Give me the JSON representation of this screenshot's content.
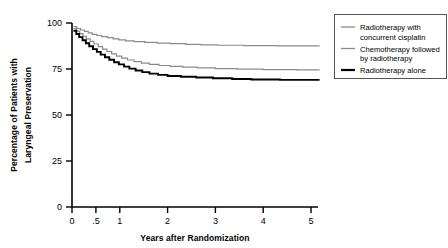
{
  "chart_data": {
    "type": "line",
    "title": "",
    "xlabel": "Years after Randomization",
    "ylabel": "Percentage of Patients with Laryngeal Preservation",
    "ylabel_line1": "Percentage of Patients with",
    "ylabel_line2": "Laryngeal Preservation",
    "xlim": [
      0,
      5.3
    ],
    "ylim": [
      0,
      100
    ],
    "xticks": [
      0,
      0.5,
      1,
      2,
      3,
      4,
      5
    ],
    "xticklabels": [
      "0",
      ".5",
      "1",
      "2",
      "3",
      "4",
      "5"
    ],
    "yticks": [
      0,
      25,
      50,
      75,
      100
    ],
    "yticklabels": [
      "0",
      "25",
      "50",
      "75",
      "100"
    ],
    "grid": false,
    "legend_position": "right-top",
    "series": [
      {
        "name": "Radiotherapy with concurrent cisplatin",
        "color": "#8a8a8a",
        "width": 1.2,
        "points": [
          [
            0.03,
            98.0
          ],
          [
            0.1,
            98.0
          ],
          [
            0.1,
            97.0
          ],
          [
            0.18,
            97.0
          ],
          [
            0.18,
            96.2
          ],
          [
            0.26,
            96.2
          ],
          [
            0.26,
            95.4
          ],
          [
            0.34,
            95.4
          ],
          [
            0.34,
            94.6
          ],
          [
            0.42,
            94.6
          ],
          [
            0.42,
            93.8
          ],
          [
            0.52,
            93.8
          ],
          [
            0.52,
            93.2
          ],
          [
            0.62,
            93.2
          ],
          [
            0.62,
            92.6
          ],
          [
            0.74,
            92.6
          ],
          [
            0.74,
            92.0
          ],
          [
            0.86,
            92.0
          ],
          [
            0.86,
            91.4
          ],
          [
            0.98,
            91.4
          ],
          [
            0.98,
            90.8
          ],
          [
            1.12,
            90.8
          ],
          [
            1.12,
            90.3
          ],
          [
            1.3,
            90.3
          ],
          [
            1.3,
            89.9
          ],
          [
            1.52,
            89.9
          ],
          [
            1.52,
            89.5
          ],
          [
            1.78,
            89.5
          ],
          [
            1.78,
            89.1
          ],
          [
            2.05,
            89.1
          ],
          [
            2.05,
            88.8
          ],
          [
            2.38,
            88.8
          ],
          [
            2.38,
            88.4
          ],
          [
            2.7,
            88.4
          ],
          [
            2.7,
            88.1
          ],
          [
            3.05,
            88.1
          ],
          [
            3.05,
            87.9
          ],
          [
            3.6,
            87.9
          ],
          [
            3.6,
            87.7
          ],
          [
            4.3,
            87.7
          ],
          [
            4.3,
            87.6
          ],
          [
            5.18,
            87.6
          ]
        ],
        "start_value": 98.0,
        "end_value": 87.6
      },
      {
        "name": "Chemotherapy followed by radiotherapy",
        "color": "#8a8a8a",
        "width": 1.2,
        "points": [
          [
            0.03,
            97.0
          ],
          [
            0.09,
            97.0
          ],
          [
            0.09,
            95.6
          ],
          [
            0.16,
            95.6
          ],
          [
            0.16,
            94.2
          ],
          [
            0.23,
            94.2
          ],
          [
            0.23,
            92.8
          ],
          [
            0.3,
            92.8
          ],
          [
            0.3,
            91.4
          ],
          [
            0.38,
            91.4
          ],
          [
            0.38,
            90.0
          ],
          [
            0.46,
            90.0
          ],
          [
            0.46,
            88.6
          ],
          [
            0.55,
            88.6
          ],
          [
            0.55,
            87.2
          ],
          [
            0.64,
            87.2
          ],
          [
            0.64,
            85.8
          ],
          [
            0.73,
            85.8
          ],
          [
            0.73,
            84.5
          ],
          [
            0.83,
            84.5
          ],
          [
            0.83,
            83.2
          ],
          [
            0.93,
            83.2
          ],
          [
            0.93,
            82.0
          ],
          [
            1.04,
            82.0
          ],
          [
            1.04,
            80.9
          ],
          [
            1.16,
            80.9
          ],
          [
            1.16,
            79.9
          ],
          [
            1.3,
            79.9
          ],
          [
            1.3,
            79.0
          ],
          [
            1.45,
            79.0
          ],
          [
            1.45,
            78.2
          ],
          [
            1.62,
            78.2
          ],
          [
            1.62,
            77.5
          ],
          [
            1.82,
            77.5
          ],
          [
            1.82,
            76.9
          ],
          [
            2.05,
            76.9
          ],
          [
            2.05,
            76.4
          ],
          [
            2.32,
            76.4
          ],
          [
            2.32,
            76.0
          ],
          [
            2.62,
            76.0
          ],
          [
            2.62,
            75.6
          ],
          [
            3.0,
            75.6
          ],
          [
            3.0,
            75.2
          ],
          [
            3.45,
            75.2
          ],
          [
            3.45,
            74.9
          ],
          [
            4.0,
            74.9
          ],
          [
            4.0,
            74.7
          ],
          [
            4.7,
            74.7
          ],
          [
            4.7,
            74.5
          ],
          [
            5.18,
            74.5
          ]
        ],
        "start_value": 97.0,
        "end_value": 74.5
      },
      {
        "name": "Radiotherapy alone",
        "color": "#000000",
        "width": 1.9,
        "points": [
          [
            0.03,
            95.8
          ],
          [
            0.09,
            95.8
          ],
          [
            0.09,
            94.0
          ],
          [
            0.15,
            94.0
          ],
          [
            0.15,
            92.3
          ],
          [
            0.22,
            92.3
          ],
          [
            0.22,
            90.6
          ],
          [
            0.29,
            90.6
          ],
          [
            0.29,
            89.0
          ],
          [
            0.36,
            89.0
          ],
          [
            0.36,
            87.4
          ],
          [
            0.44,
            87.4
          ],
          [
            0.44,
            85.8
          ],
          [
            0.52,
            85.8
          ],
          [
            0.52,
            84.3
          ],
          [
            0.6,
            84.3
          ],
          [
            0.6,
            82.8
          ],
          [
            0.69,
            82.8
          ],
          [
            0.69,
            81.4
          ],
          [
            0.78,
            81.4
          ],
          [
            0.78,
            80.0
          ],
          [
            0.88,
            80.0
          ],
          [
            0.88,
            78.7
          ],
          [
            0.98,
            78.7
          ],
          [
            0.98,
            77.5
          ],
          [
            1.09,
            77.5
          ],
          [
            1.09,
            76.3
          ],
          [
            1.2,
            76.3
          ],
          [
            1.2,
            75.2
          ],
          [
            1.33,
            75.2
          ],
          [
            1.33,
            74.2
          ],
          [
            1.47,
            74.2
          ],
          [
            1.47,
            73.3
          ],
          [
            1.62,
            73.3
          ],
          [
            1.62,
            72.5
          ],
          [
            1.8,
            72.5
          ],
          [
            1.8,
            71.8
          ],
          [
            2.0,
            71.8
          ],
          [
            2.0,
            71.2
          ],
          [
            2.28,
            71.2
          ],
          [
            2.28,
            70.8
          ],
          [
            2.6,
            70.8
          ],
          [
            2.6,
            70.4
          ],
          [
            2.95,
            70.4
          ],
          [
            2.95,
            70.0
          ],
          [
            3.35,
            70.0
          ],
          [
            3.35,
            69.6
          ],
          [
            3.75,
            69.6
          ],
          [
            3.75,
            69.3
          ],
          [
            4.35,
            69.3
          ],
          [
            4.35,
            69.1
          ],
          [
            5.18,
            69.1
          ]
        ],
        "start_value": 95.8,
        "end_value": 69.1
      }
    ]
  },
  "axis": {
    "x_title": "Years after Randomization",
    "y_title_line1": "Percentage of Patients with",
    "y_title_line2": "Laryngeal Preservation",
    "xticklabels": [
      "0",
      ".5",
      "1",
      "2",
      "3",
      "4",
      "5"
    ],
    "yticklabels": [
      "0",
      "25",
      "50",
      "75",
      "100"
    ]
  },
  "legend": {
    "items": [
      {
        "label_line1": "Radiotherapy with",
        "label_line2": "concurrent cisplatin",
        "swatch": "legend-line-gray-thin",
        "color": "#8a8a8a"
      },
      {
        "label_line1": "Chemotherapy followed",
        "label_line2": "by radiotherapy",
        "swatch": "legend-line-gray-thin",
        "color": "#8a8a8a"
      },
      {
        "label_line1": "Radiotherapy alone",
        "label_line2": "",
        "swatch": "legend-line-black-thick",
        "color": "#000000"
      }
    ],
    "border_color": "#555555"
  },
  "colors": {
    "axis": "#000000",
    "series_gray": "#8a8a8a",
    "series_black": "#000000",
    "background": "#ffffff"
  }
}
